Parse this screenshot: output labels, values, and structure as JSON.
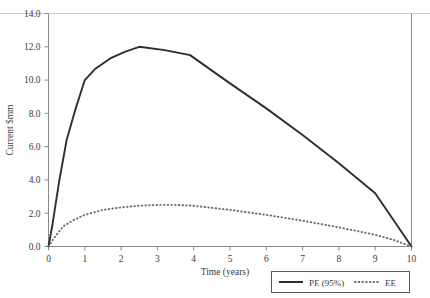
{
  "chart_data": {
    "type": "line",
    "title": "",
    "xlabel": "Time (years)",
    "ylabel": "Current $mm",
    "xlim": [
      0,
      10
    ],
    "ylim": [
      0,
      14
    ],
    "xticks": [
      "0",
      "1",
      "2",
      "3",
      "4",
      "5",
      "6",
      "7",
      "8",
      "9",
      "10"
    ],
    "yticks": [
      "0.0",
      "2.0",
      "4.0",
      "6.0",
      "8.0",
      "10.0",
      "12.0",
      "14.0"
    ],
    "grid": false,
    "legend_position": "bottom-right",
    "series": [
      {
        "name": "PE (95%)",
        "style": "solid",
        "color": "#2e2e2e",
        "x": [
          0.0,
          0.1,
          0.3,
          0.5,
          0.75,
          1.0,
          1.3,
          1.7,
          2.1,
          2.5,
          3.2,
          3.9,
          5.0,
          6.0,
          7.0,
          8.0,
          9.0,
          10.0
        ],
        "y": [
          0.0,
          1.2,
          4.0,
          6.4,
          8.3,
          10.0,
          10.7,
          11.3,
          11.7,
          12.0,
          11.8,
          11.5,
          9.8,
          8.3,
          6.7,
          5.0,
          3.2,
          0.0
        ]
      },
      {
        "name": "EE",
        "style": "dotted",
        "color": "#6b6b6b",
        "x": [
          0.0,
          0.15,
          0.4,
          0.7,
          1.0,
          1.5,
          2.0,
          2.5,
          3.0,
          3.5,
          4.0,
          5.0,
          6.0,
          7.0,
          8.0,
          9.0,
          9.5,
          10.0
        ],
        "y": [
          0.0,
          0.5,
          1.2,
          1.6,
          1.9,
          2.2,
          2.35,
          2.45,
          2.5,
          2.5,
          2.45,
          2.2,
          1.9,
          1.55,
          1.15,
          0.7,
          0.4,
          0.0
        ]
      }
    ]
  },
  "legend": {
    "items": [
      {
        "label": "PE (95%)",
        "style": "solid"
      },
      {
        "label": "EE",
        "style": "dotted"
      }
    ]
  }
}
